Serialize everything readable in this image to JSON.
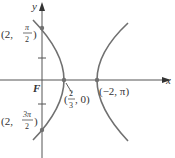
{
  "figure": {
    "type": "polar-conic-hyperbola",
    "colors": {
      "axis": "#555555",
      "curve": "#707070",
      "text": "#333333",
      "point": "#707070"
    },
    "axes": {
      "x_label": "x",
      "y_label": "y",
      "origin_label": "F"
    },
    "points": [
      {
        "id": "p1",
        "label_prefix": "(2, ",
        "frac_num": "π",
        "frac_den": "2",
        "label_suffix": ")",
        "px": 42,
        "py": 28
      },
      {
        "id": "p2",
        "label_prefix": "(",
        "frac_num": "2",
        "frac_den": "3",
        "label_suffix": ", 0)",
        "px": 64,
        "py": 80
      },
      {
        "id": "p3",
        "label": "(−2, π)",
        "px": 97,
        "py": 80
      },
      {
        "id": "p4",
        "label_prefix": "(2, ",
        "frac_num": "3π",
        "frac_den": "2",
        "label_suffix": ")",
        "px": 42,
        "py": 130
      }
    ]
  }
}
